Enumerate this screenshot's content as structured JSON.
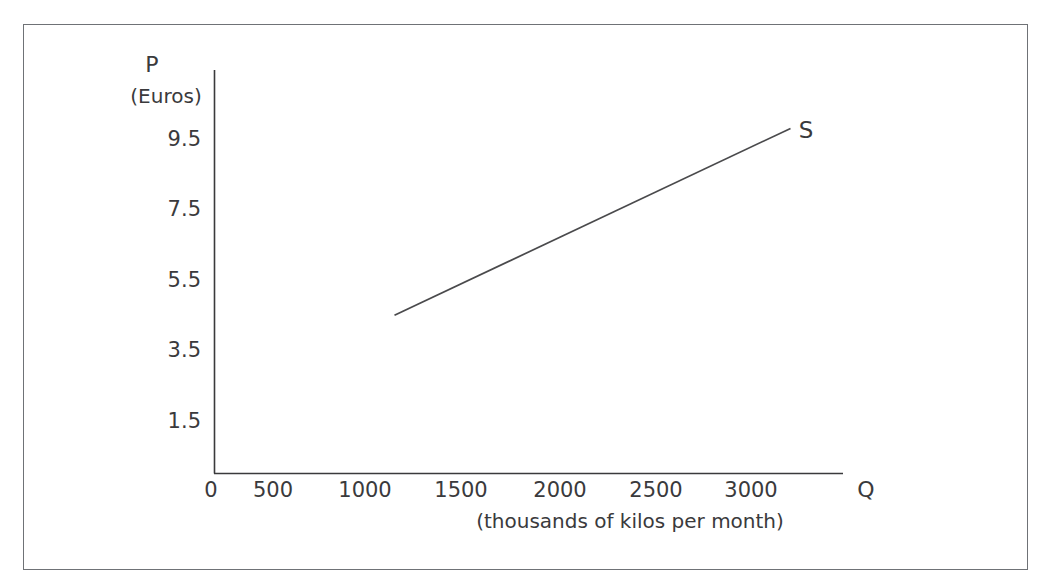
{
  "figure": {
    "border_color": "#6f7276",
    "background": "#ffffff",
    "axis_color": "#3a3a3c",
    "line_color": "#4a4a4c"
  },
  "chart_data": {
    "type": "line",
    "title": "",
    "subtitle": "",
    "xlabel": "Q",
    "xlabel_sub": "(thousands of kilos per month)",
    "ylabel": "P",
    "ylabel_sub": "(Euros)",
    "xlim": [
      0,
      3400
    ],
    "ylim": [
      0,
      10.8
    ],
    "xticks": [
      0,
      500,
      1000,
      1500,
      2000,
      2500,
      3000
    ],
    "xticklabels": [
      "0",
      "500",
      "1000",
      "1500",
      "2000",
      "2500",
      "3000"
    ],
    "yticks": [
      1.5,
      3.5,
      5.5,
      7.5,
      9.5
    ],
    "yticklabels": [
      "1.5",
      "3.5",
      "5.5",
      "7.5",
      "9.5"
    ],
    "grid": false,
    "legend": "none",
    "series": [
      {
        "name": "S",
        "label": "S",
        "description": "supply curve",
        "x": [
          1000,
          3200
        ],
        "y": [
          4.5,
          9.8
        ]
      }
    ]
  },
  "labels": {
    "y_axis_title": "P",
    "y_axis_units": "(Euros)",
    "x_axis_title": "Q",
    "x_axis_units": "(thousands of kilos per month)",
    "supply_curve": "S",
    "ytick_9_5": "9.5",
    "ytick_7_5": "7.5",
    "ytick_5_5": "5.5",
    "ytick_3_5": "3.5",
    "ytick_1_5": "1.5",
    "xtick_0": "0",
    "xtick_500": "500",
    "xtick_1000": "1000",
    "xtick_1500": "1500",
    "xtick_2000": "2000",
    "xtick_2500": "2500",
    "xtick_3000": "3000"
  }
}
